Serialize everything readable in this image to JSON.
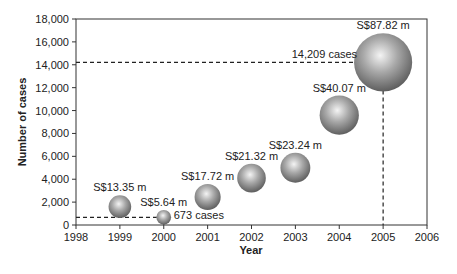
{
  "chart_data": {
    "type": "scatter",
    "subtype": "bubble",
    "title": "",
    "xlabel": "Year",
    "ylabel": "Number of cases",
    "xlim": [
      1998,
      2006
    ],
    "ylim": [
      0,
      18000
    ],
    "x_ticks": [
      "1998",
      "1999",
      "2000",
      "2001",
      "2002",
      "2003",
      "2004",
      "2005",
      "2006"
    ],
    "y_ticks": [
      "0",
      "2,000",
      "4,000",
      "6,000",
      "8,000",
      "10,000",
      "12,000",
      "14,000",
      "16,000",
      "18,000"
    ],
    "grid": false,
    "legend": null,
    "points": [
      {
        "x": 1999,
        "y": 1600,
        "size_label": "S$13.35 m",
        "size": 13.35
      },
      {
        "x": 2000,
        "y": 673,
        "size_label": "S$5.64 m",
        "size": 5.64
      },
      {
        "x": 2001,
        "y": 2450,
        "size_label": "S$17.72 m",
        "size": 17.72
      },
      {
        "x": 2002,
        "y": 4100,
        "size_label": "S$21.32 m",
        "size": 21.32
      },
      {
        "x": 2003,
        "y": 5000,
        "size_label": "S$23.24 m",
        "size": 23.24
      },
      {
        "x": 2004,
        "y": 9600,
        "size_label": "S$40.07 m",
        "size": 40.07
      },
      {
        "x": 2005,
        "y": 14209,
        "size_label": "S$87.82 m",
        "size": 87.82
      }
    ],
    "annotations": [
      {
        "text": "673 cases",
        "x": 2000,
        "y": 673
      },
      {
        "text": "14,209 cases",
        "x": 2005,
        "y": 14209
      }
    ]
  }
}
